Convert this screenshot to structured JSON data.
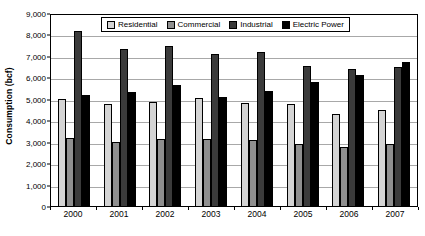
{
  "chart_data": {
    "type": "bar",
    "title": "",
    "xlabel": "",
    "ylabel": "Consumption (bcf)",
    "ylim": [
      0,
      9000
    ],
    "ytick_step": 1000,
    "grid": true,
    "legend_position": "top-center",
    "categories": [
      "2000",
      "2001",
      "2002",
      "2003",
      "2004",
      "2005",
      "2006",
      "2007"
    ],
    "ytick_labels": [
      "9,000",
      "8,000",
      "7,000",
      "6,000",
      "5,000",
      "4,000",
      "3,000",
      "2,000",
      "1,000",
      "0"
    ],
    "series": [
      {
        "name": "Residential",
        "color": "#d4d4d4",
        "values": [
          4990,
          4750,
          4840,
          5030,
          4800,
          4740,
          4270,
          4490
        ]
      },
      {
        "name": "Commercial",
        "color": "#8f8f8f",
        "values": [
          3180,
          3000,
          3110,
          3130,
          3070,
          2890,
          2740,
          2900
        ]
      },
      {
        "name": "Industrial",
        "color": "#3b3b3b",
        "values": [
          8140,
          7320,
          7470,
          7100,
          7170,
          6520,
          6400,
          6490
        ]
      },
      {
        "name": "Electric Power",
        "color": "#000000",
        "values": [
          5180,
          5300,
          5620,
          5070,
          5380,
          5770,
          6110,
          6700
        ]
      }
    ]
  }
}
